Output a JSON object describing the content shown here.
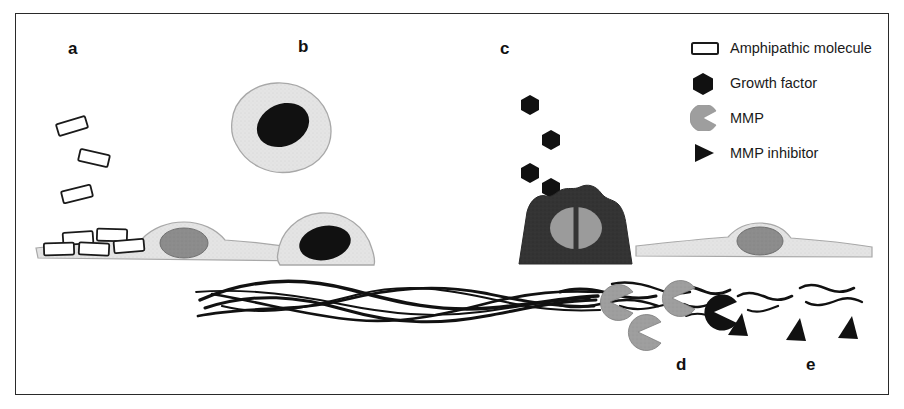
{
  "figure": {
    "type": "scientific-schematic",
    "background_color": "#ffffff",
    "frame_color": "#2a2a2a"
  },
  "palette": {
    "cell_body": "#e2e2e2",
    "cell_outline": "#9a9a9a",
    "nucleus_gray": "#8c8c8c",
    "nucleus_dark": "#111111",
    "activated_cell": "#343434",
    "mmp_gray": "#9e9e9e",
    "mmp_inhibited": "#111111",
    "growth_factor": "#111111",
    "ecm_fiber": "#111111",
    "molecule_fill": "#ffffff",
    "molecule_outline": "#1a1a1a",
    "label_color": "#111111"
  },
  "panels": [
    {
      "id": "a",
      "label": "a",
      "x": 68,
      "y": 40,
      "description": "Amphipathic molecules accumulate at the surface of a flat adherent cell"
    },
    {
      "id": "b",
      "label": "b",
      "x": 298,
      "y": 38,
      "description": "Cells round up and detach from the matrix"
    },
    {
      "id": "c",
      "label": "c",
      "x": 500,
      "y": 40,
      "description": "Activated dividing cell releases growth factors"
    },
    {
      "id": "d",
      "label": "d",
      "x": 676,
      "y": 356,
      "description": "MMPs degrade extracellular matrix fibers"
    },
    {
      "id": "e",
      "label": "e",
      "x": 806,
      "y": 356,
      "description": "MMP inhibitors block MMP activity and matrix degradation is halted"
    }
  ],
  "legend": {
    "items": [
      {
        "icon": "rectangle-outline-icon",
        "label": "Amphipathic molecule",
        "color": "#ffffff"
      },
      {
        "icon": "hexagon-filled-icon",
        "label": "Growth factor",
        "color": "#111111"
      },
      {
        "icon": "pacman-icon",
        "label": "MMP",
        "color": "#9e9e9e"
      },
      {
        "icon": "triangle-right-icon",
        "label": "MMP inhibitor",
        "color": "#111111"
      }
    ]
  },
  "elements": {
    "free_molecules_count": 3,
    "bound_molecules_count": 5,
    "rounded_cells_count": 2,
    "growth_factors_count": 4,
    "mmp_count": 3,
    "mmp_inhibited_count": 1,
    "inhibitor_count": 3,
    "flat_cells_count": 2
  }
}
